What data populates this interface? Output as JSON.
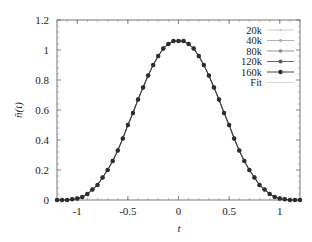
{
  "chart_data": {
    "type": "line",
    "title": "",
    "xlabel": "t",
    "ylabel": "n̄(t)",
    "xlim": [
      -1.2,
      1.2
    ],
    "ylim": [
      0,
      1.2
    ],
    "xticks": [
      -1,
      -0.5,
      0,
      0.5,
      1
    ],
    "xtick_labels": [
      "-1",
      "-0.5",
      "0",
      "0.5",
      "1"
    ],
    "yticks": [
      0,
      0.2,
      0.4,
      0.6,
      0.8,
      1,
      1.2
    ],
    "ytick_labels": [
      "0",
      "0.2",
      "0.4",
      "0.6",
      "0.8",
      "1",
      "1.2"
    ],
    "grid": false,
    "legend_position": "upper right",
    "x": [
      -1.2,
      -1.15,
      -1.1,
      -1.05,
      -1.0,
      -0.95,
      -0.9,
      -0.85,
      -0.8,
      -0.75,
      -0.7,
      -0.65,
      -0.6,
      -0.55,
      -0.5,
      -0.45,
      -0.4,
      -0.35,
      -0.3,
      -0.25,
      -0.2,
      -0.15,
      -0.1,
      -0.05,
      0.0,
      0.05,
      0.1,
      0.15,
      0.2,
      0.25,
      0.3,
      0.35,
      0.4,
      0.45,
      0.5,
      0.55,
      0.6,
      0.65,
      0.7,
      0.75,
      0.8,
      0.85,
      0.9,
      0.95,
      1.0,
      1.05,
      1.1,
      1.15,
      1.2
    ],
    "series": [
      {
        "name": "20k",
        "color": "#c8c8c8",
        "marker_size": 1.2,
        "values": [
          0.0,
          0.0,
          0.0,
          0.005,
          0.01,
          0.02,
          0.04,
          0.07,
          0.1,
          0.15,
          0.2,
          0.26,
          0.33,
          0.41,
          0.5,
          0.58,
          0.67,
          0.75,
          0.83,
          0.9,
          0.96,
          1.01,
          1.04,
          1.06,
          1.06,
          1.06,
          1.04,
          1.01,
          0.96,
          0.9,
          0.83,
          0.75,
          0.67,
          0.58,
          0.5,
          0.41,
          0.33,
          0.26,
          0.2,
          0.15,
          0.1,
          0.07,
          0.04,
          0.02,
          0.01,
          0.005,
          0.0,
          0.0,
          0.0
        ]
      },
      {
        "name": "40k",
        "color": "#a8a8a8",
        "marker_size": 1.5,
        "values": [
          0.0,
          0.0,
          0.0,
          0.005,
          0.01,
          0.02,
          0.04,
          0.07,
          0.1,
          0.15,
          0.2,
          0.26,
          0.33,
          0.41,
          0.5,
          0.58,
          0.67,
          0.75,
          0.83,
          0.9,
          0.96,
          1.01,
          1.04,
          1.06,
          1.06,
          1.06,
          1.04,
          1.01,
          0.96,
          0.9,
          0.83,
          0.75,
          0.67,
          0.58,
          0.5,
          0.41,
          0.33,
          0.26,
          0.2,
          0.15,
          0.1,
          0.07,
          0.04,
          0.02,
          0.01,
          0.005,
          0.0,
          0.0,
          0.0
        ]
      },
      {
        "name": "80k",
        "color": "#888888",
        "marker_size": 1.8,
        "values": [
          0.0,
          0.0,
          0.0,
          0.005,
          0.01,
          0.02,
          0.04,
          0.07,
          0.1,
          0.15,
          0.2,
          0.26,
          0.33,
          0.41,
          0.5,
          0.58,
          0.67,
          0.75,
          0.83,
          0.9,
          0.96,
          1.01,
          1.04,
          1.06,
          1.06,
          1.06,
          1.04,
          1.01,
          0.96,
          0.9,
          0.83,
          0.75,
          0.67,
          0.58,
          0.5,
          0.41,
          0.33,
          0.26,
          0.2,
          0.15,
          0.1,
          0.07,
          0.04,
          0.02,
          0.01,
          0.005,
          0.0,
          0.0,
          0.0
        ]
      },
      {
        "name": "120k",
        "color": "#5a5a5a",
        "marker_size": 2.0,
        "values": [
          0.0,
          0.0,
          0.0,
          0.005,
          0.01,
          0.02,
          0.04,
          0.07,
          0.1,
          0.15,
          0.2,
          0.26,
          0.33,
          0.41,
          0.5,
          0.58,
          0.67,
          0.75,
          0.83,
          0.9,
          0.96,
          1.01,
          1.04,
          1.06,
          1.06,
          1.06,
          1.04,
          1.01,
          0.96,
          0.9,
          0.83,
          0.75,
          0.67,
          0.58,
          0.5,
          0.41,
          0.33,
          0.26,
          0.2,
          0.15,
          0.1,
          0.07,
          0.04,
          0.02,
          0.01,
          0.005,
          0.0,
          0.0,
          0.0
        ]
      },
      {
        "name": "160k",
        "color": "#2e2e2e",
        "marker_size": 2.2,
        "values": [
          0.0,
          0.0,
          0.0,
          0.005,
          0.01,
          0.02,
          0.04,
          0.07,
          0.1,
          0.15,
          0.2,
          0.26,
          0.33,
          0.41,
          0.5,
          0.58,
          0.67,
          0.75,
          0.83,
          0.9,
          0.96,
          1.01,
          1.04,
          1.06,
          1.06,
          1.06,
          1.04,
          1.01,
          0.96,
          0.9,
          0.83,
          0.75,
          0.67,
          0.58,
          0.5,
          0.41,
          0.33,
          0.26,
          0.2,
          0.15,
          0.1,
          0.07,
          0.04,
          0.02,
          0.01,
          0.005,
          0.0,
          0.0,
          0.0
        ]
      },
      {
        "name": "Fit",
        "color": "#d4d4d4",
        "marker_size": 0,
        "values": [
          0.0,
          0.0,
          0.0,
          0.005,
          0.01,
          0.02,
          0.04,
          0.07,
          0.1,
          0.15,
          0.2,
          0.26,
          0.33,
          0.41,
          0.5,
          0.58,
          0.67,
          0.75,
          0.83,
          0.9,
          0.96,
          1.01,
          1.04,
          1.06,
          1.06,
          1.06,
          1.04,
          1.01,
          0.96,
          0.9,
          0.83,
          0.75,
          0.67,
          0.58,
          0.5,
          0.41,
          0.33,
          0.26,
          0.2,
          0.15,
          0.1,
          0.07,
          0.04,
          0.02,
          0.01,
          0.005,
          0.0,
          0.0,
          0.0
        ]
      }
    ]
  }
}
